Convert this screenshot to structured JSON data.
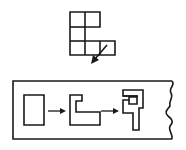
{
  "diagram": {
    "top_figure": {
      "name": "polyomino-grid",
      "cell_size": 15,
      "origin": [
        70,
        12
      ],
      "cells": [
        [
          0,
          0
        ],
        [
          1,
          0
        ],
        [
          0,
          1
        ],
        [
          0,
          2
        ],
        [
          1,
          2
        ],
        [
          2,
          2
        ]
      ],
      "arrow": {
        "from": [
          107,
          45
        ],
        "to": [
          91,
          63
        ]
      }
    },
    "strip": {
      "frame": {
        "x": 13,
        "y": 81,
        "width": 161,
        "height": 58,
        "right_edge": "wavy"
      },
      "steps": [
        {
          "name": "rectangle-shape",
          "points": "24,95 44,95 44,125 24,125"
        },
        {
          "name": "c-shape",
          "points": "70,95 82,95 82,101 75,101 75,112 100,112 100,125 70,125"
        },
        {
          "name": "hook-shape",
          "points": "123,90 144,90 144,108 139,108 139,130 132,130 132,113 123,113 123,100 129,100 129,108 137,108 137,96 123,96"
        }
      ],
      "arrows": [
        {
          "from": [
            48,
            111
          ],
          "to": [
            66,
            111
          ]
        },
        {
          "from": [
            101,
            111
          ],
          "to": [
            119,
            111
          ]
        }
      ]
    },
    "colors": {
      "stroke": "#1a1a1a",
      "background": "#ffffff"
    }
  }
}
